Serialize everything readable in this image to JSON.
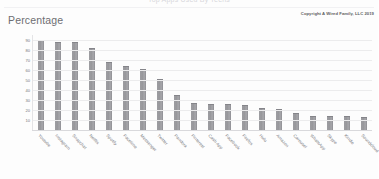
{
  "header": {
    "title": "Top Apps Used By Teens",
    "axis_title": "Percentage",
    "copyright": "Copyright A Wired Family, LLC 2019"
  },
  "chart_data": {
    "type": "bar",
    "title": "Top Apps Used By Teens",
    "xlabel": "",
    "ylabel": "Percentage",
    "ylim": [
      0,
      95
    ],
    "yticks": [
      90,
      80,
      70,
      60,
      50,
      40,
      30,
      20,
      10
    ],
    "grid": true,
    "legend": false,
    "bar_color": "#98989c",
    "categories": [
      "Youtube",
      "Instagram",
      "Snapchat",
      "Netflix",
      "Spotify",
      "Facetime",
      "Messenger",
      "Twitter",
      "Pandora",
      "Pinterest",
      "Cash App",
      "Facebook",
      "Firefox",
      "Hulu",
      "Amazon",
      "Carousel",
      "WhatsApp",
      "Skype",
      "Kindle",
      "Soundcloud"
    ],
    "values": [
      90,
      88,
      88,
      82,
      68,
      64,
      61,
      51,
      35,
      27,
      26,
      26,
      25,
      22,
      21,
      17,
      14,
      14,
      14,
      13
    ]
  }
}
